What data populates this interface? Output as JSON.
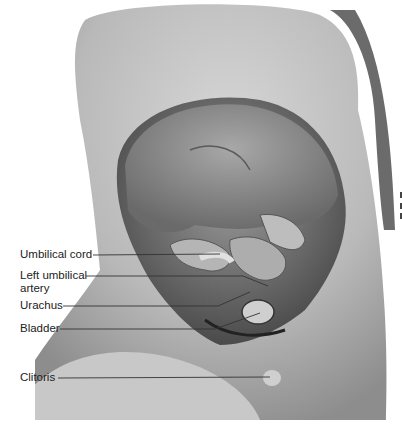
{
  "figure": {
    "labels": [
      {
        "text": "Umbilical cord",
        "x": 20,
        "y": 250,
        "line": [
          93,
          255,
          220,
          254
        ]
      },
      {
        "text": "Left umbilical",
        "text2": "artery",
        "x": 20,
        "y": 271,
        "line": [
          86,
          276,
          243,
          276,
          268,
          286
        ]
      },
      {
        "text": "Urachus",
        "x": 20,
        "y": 301,
        "line": [
          63,
          306,
          218,
          306,
          250,
          292
        ]
      },
      {
        "text": "Bladder",
        "x": 20,
        "y": 324,
        "line": [
          60,
          329,
          215,
          329,
          260,
          313
        ]
      },
      {
        "text": "Clitoris",
        "x": 20,
        "y": 373,
        "line": [
          58,
          378,
          270,
          377
        ]
      }
    ]
  }
}
